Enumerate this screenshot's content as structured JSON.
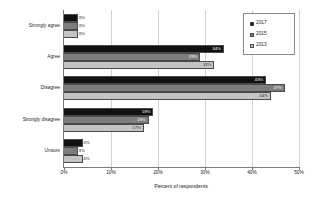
{
  "chart_data": {
    "type": "bar",
    "orientation": "horizontal",
    "title": "",
    "xlabel": "Percent of respondents",
    "ylabel": "",
    "xlim": [
      0,
      50
    ],
    "xticks": [
      "0%",
      "10%",
      "20%",
      "30%",
      "40%",
      "50%"
    ],
    "xtick_values": [
      0,
      10,
      20,
      30,
      40,
      50
    ],
    "grid": true,
    "grid_axis": "x",
    "legend_position": "upper right",
    "categories": [
      "Strongly agree",
      "Agree",
      "Disagree",
      "Strongly disagree",
      "Unsure"
    ],
    "series": [
      {
        "name": "2017",
        "color": "#111111",
        "values": [
          3,
          34,
          43,
          19,
          4
        ],
        "labels": [
          "3%",
          "34%",
          "43%",
          "19%",
          "4%"
        ]
      },
      {
        "name": "2015",
        "color": "#7d7d7d",
        "values": [
          3,
          29,
          47,
          18,
          3
        ],
        "labels": [
          "3%",
          "29%",
          "47%",
          "18%",
          "3%"
        ]
      },
      {
        "name": "2013",
        "color": "#c4c4c4",
        "values": [
          3,
          32,
          44,
          17,
          4
        ],
        "labels": [
          "3%",
          "32%",
          "44%",
          "17%",
          "4%"
        ]
      }
    ]
  },
  "legend": {
    "items": [
      {
        "label": "2017"
      },
      {
        "label": "2015"
      },
      {
        "label": "2013"
      }
    ]
  },
  "axis": {
    "x_title": "Percent of respondents",
    "ticks": [
      {
        "label": "0%"
      },
      {
        "label": "10%"
      },
      {
        "label": "20%"
      },
      {
        "label": "30%"
      },
      {
        "label": "40%"
      },
      {
        "label": "50%"
      }
    ]
  },
  "categories": [
    {
      "label": "Strongly agree"
    },
    {
      "label": "Agree"
    },
    {
      "label": "Disagree"
    },
    {
      "label": "Strongly disagree"
    },
    {
      "label": "Unsure"
    }
  ],
  "bars": {
    "strongly_agree": [
      {
        "series": "2017",
        "value": 3,
        "label": "3%"
      },
      {
        "series": "2015",
        "value": 3,
        "label": "3%"
      },
      {
        "series": "2013",
        "value": 3,
        "label": "3%"
      }
    ],
    "agree": [
      {
        "series": "2017",
        "value": 34,
        "label": "34%"
      },
      {
        "series": "2015",
        "value": 29,
        "label": "29%"
      },
      {
        "series": "2013",
        "value": 32,
        "label": "32%"
      }
    ],
    "disagree": [
      {
        "series": "2017",
        "value": 43,
        "label": "43%"
      },
      {
        "series": "2015",
        "value": 47,
        "label": "47%"
      },
      {
        "series": "2013",
        "value": 44,
        "label": "44%"
      }
    ],
    "strongly_disagree": [
      {
        "series": "2017",
        "value": 19,
        "label": "19%"
      },
      {
        "series": "2015",
        "value": 18,
        "label": "18%"
      },
      {
        "series": "2013",
        "value": 17,
        "label": "17%"
      }
    ],
    "unsure": [
      {
        "series": "2017",
        "value": 4,
        "label": "4%"
      },
      {
        "series": "2015",
        "value": 3,
        "label": "3%"
      },
      {
        "series": "2013",
        "value": 4,
        "label": "4%"
      }
    ]
  }
}
